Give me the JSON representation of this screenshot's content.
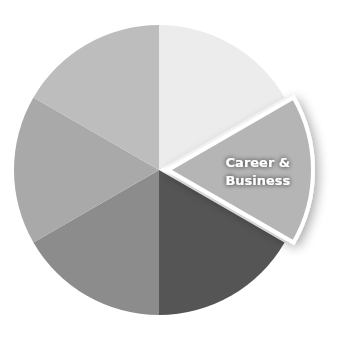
{
  "chart_data": {
    "type": "pie",
    "title": "",
    "categories": [
      "Slice 1",
      "Career & Business",
      "Slice 3",
      "Slice 4",
      "Slice 5",
      "Slice 6"
    ],
    "values": [
      1,
      1,
      1,
      1,
      1,
      1
    ],
    "labels_visible": [
      "",
      "Career & Business",
      "",
      "",
      "",
      ""
    ],
    "highlighted": "Career & Business",
    "exploded_index": 1,
    "colors": [
      "#ececec",
      "#b5b5b5",
      "#555555",
      "#8c8c8c",
      "#a9a9a9",
      "#bdbdbd"
    ],
    "legend": "none"
  },
  "highlight_label": {
    "line1": "Career &",
    "line2": "Business"
  }
}
